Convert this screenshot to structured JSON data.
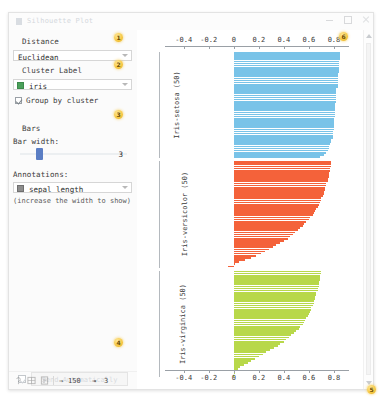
{
  "window": {
    "title": "Silhouette Plot",
    "icon": "widget-icon",
    "buttons": {
      "minimize": "minimize-icon",
      "maximize": "maximize-icon",
      "close": "close-icon"
    }
  },
  "controls": {
    "distance": {
      "label": "Distance",
      "value": "Euclidean"
    },
    "cluster_label": {
      "label": "Cluster Label",
      "value": "iris",
      "swatch_color": "#4aa05a"
    },
    "group_by_cluster": {
      "label": "Group by cluster",
      "checked": true
    },
    "bars": {
      "label": "Bars",
      "bar_width_label": "Bar width:",
      "bar_width_value": "3"
    },
    "annotations": {
      "label": "Annotations:",
      "value": "sepal length",
      "hint": "(increase the width to show)"
    },
    "send": {
      "label": "Send Automatically",
      "checked": true
    }
  },
  "statusbar": {
    "icons": [
      "help-icon",
      "report-icon",
      "snapshot-icon"
    ],
    "input_count": "150",
    "output_count": "3",
    "input_arrow": "→",
    "output_arrow": "⇥"
  },
  "badges": [
    {
      "n": "1",
      "name": "badge-distance",
      "x": 114,
      "y": 33
    },
    {
      "n": "2",
      "name": "badge-cluster-label",
      "x": 114,
      "y": 60
    },
    {
      "n": "3",
      "name": "badge-bars",
      "x": 114,
      "y": 110
    },
    {
      "n": "4",
      "name": "badge-send",
      "x": 114,
      "y": 338
    },
    {
      "n": "5",
      "name": "badge-statusbar",
      "x": 367,
      "y": 385
    },
    {
      "n": "6",
      "name": "badge-plot",
      "x": 339,
      "y": 32
    }
  ],
  "chart_data": {
    "type": "bar",
    "title": "Silhouette Plot",
    "xlabel": "",
    "ylabel": "",
    "grid": false,
    "legend": "none",
    "xlim": [
      -0.55,
      0.92
    ],
    "xticks": [
      -0.4,
      -0.2,
      0,
      0.2,
      0.4,
      0.6,
      0.8
    ],
    "xticklabels": [
      "-0.4",
      "-0.2",
      "0",
      "0.2",
      "0.4",
      "0.6",
      "0.8"
    ],
    "axis_top": true,
    "axis_bottom": true,
    "groups": [
      {
        "name": "Iris-setosa (50)",
        "count": 50,
        "color": "#79c3e8",
        "values": [
          0.85,
          0.85,
          0.85,
          0.85,
          0.84,
          0.84,
          0.84,
          0.84,
          0.84,
          0.84,
          0.83,
          0.83,
          0.83,
          0.83,
          0.83,
          0.83,
          0.83,
          0.82,
          0.82,
          0.82,
          0.82,
          0.82,
          0.82,
          0.82,
          0.81,
          0.81,
          0.81,
          0.81,
          0.81,
          0.81,
          0.81,
          0.8,
          0.8,
          0.8,
          0.8,
          0.8,
          0.8,
          0.79,
          0.79,
          0.79,
          0.79,
          0.78,
          0.78,
          0.77,
          0.76,
          0.76,
          0.75,
          0.74,
          0.72,
          0.69
        ]
      },
      {
        "name": "Iris-versicolor (50)",
        "color": "#f4623a",
        "count": 50,
        "values": [
          0.78,
          0.78,
          0.78,
          0.77,
          0.77,
          0.76,
          0.76,
          0.76,
          0.75,
          0.75,
          0.74,
          0.74,
          0.73,
          0.73,
          0.72,
          0.72,
          0.71,
          0.7,
          0.7,
          0.69,
          0.68,
          0.67,
          0.66,
          0.65,
          0.64,
          0.63,
          0.61,
          0.6,
          0.58,
          0.56,
          0.55,
          0.53,
          0.51,
          0.49,
          0.47,
          0.45,
          0.43,
          0.4,
          0.37,
          0.34,
          0.31,
          0.28,
          0.25,
          0.22,
          0.18,
          0.14,
          0.09,
          0.04,
          0.01,
          -0.05
        ]
      },
      {
        "name": "Iris-virginica (50)",
        "color": "#b8d84a",
        "count": 50,
        "values": [
          0.7,
          0.7,
          0.69,
          0.69,
          0.69,
          0.68,
          0.68,
          0.68,
          0.67,
          0.67,
          0.66,
          0.66,
          0.65,
          0.65,
          0.64,
          0.64,
          0.63,
          0.62,
          0.62,
          0.61,
          0.6,
          0.59,
          0.58,
          0.57,
          0.56,
          0.55,
          0.53,
          0.52,
          0.5,
          0.48,
          0.46,
          0.44,
          0.42,
          0.4,
          0.37,
          0.35,
          0.32,
          0.29,
          0.26,
          0.23,
          0.2,
          0.17,
          0.14,
          0.11,
          0.08,
          0.05,
          0.03,
          0.01,
          0.0,
          -0.01
        ]
      }
    ]
  }
}
